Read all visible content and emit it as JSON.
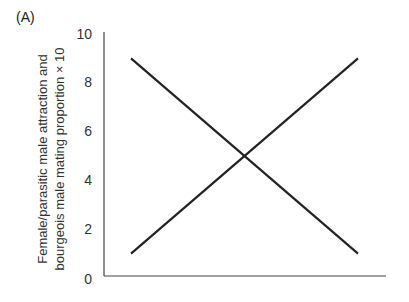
{
  "panel_label": "(A)",
  "chart_data": {
    "type": "line",
    "title": "",
    "panel": "(A)",
    "xlabel": "",
    "ylabel_lines": [
      "Female/parasitic male attraction and",
      "bourgeois male mating proportion × 10"
    ],
    "ylabel": "Female/parasitic male attraction and bourgeois male mating proportion × 10",
    "ylim": [
      0,
      10
    ],
    "yticks": [
      0,
      2,
      4,
      6,
      8,
      10
    ],
    "ytick_labels": [
      "0",
      "2",
      "4",
      "6",
      "8",
      "10"
    ],
    "xticks": [],
    "grid": false,
    "legend": null,
    "x": [
      0,
      1
    ],
    "series": [
      {
        "name": "decreasing",
        "values": [
          9,
          1
        ],
        "color": "#222222"
      },
      {
        "name": "increasing",
        "values": [
          1,
          9
        ],
        "color": "#222222"
      }
    ],
    "annotations": [
      "Lines intersect at y = 5"
    ]
  }
}
